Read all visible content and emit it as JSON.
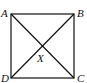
{
  "diagram": {
    "type": "square-with-diagonals",
    "vertices": [
      {
        "label": "A",
        "x": 11,
        "y": 14,
        "lx": 1,
        "ly": 17
      },
      {
        "label": "B",
        "x": 74,
        "y": 14,
        "lx": 77,
        "ly": 17
      },
      {
        "label": "C",
        "x": 74,
        "y": 78,
        "lx": 77,
        "ly": 82
      },
      {
        "label": "D",
        "x": 11,
        "y": 78,
        "lx": 1,
        "ly": 82
      }
    ],
    "intersection": {
      "label": "X",
      "x": 42.5,
      "y": 46,
      "lx": 37,
      "ly": 62
    },
    "edges": [
      [
        "A",
        "B"
      ],
      [
        "B",
        "C"
      ],
      [
        "C",
        "D"
      ],
      [
        "D",
        "A"
      ]
    ],
    "diagonals": [
      [
        "A",
        "C"
      ],
      [
        "B",
        "D"
      ]
    ],
    "stroke_color": "#111111"
  }
}
